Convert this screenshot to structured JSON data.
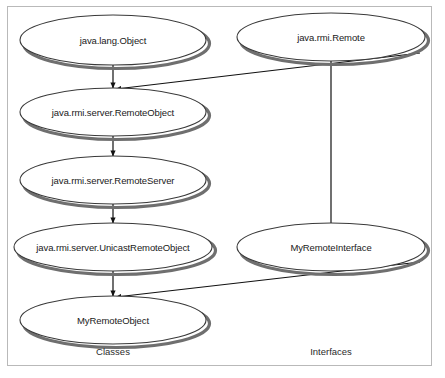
{
  "diagram": {
    "frame": {
      "stroke": "#b9b9b9"
    },
    "style": {
      "node_fill": "#ffffff",
      "node_stroke": "#3a3a3a",
      "node_shadow": "#6f6f6f",
      "edge_color": "#111111",
      "text_color": "#1a1a1a"
    },
    "nodes": [
      {
        "id": "java-lang-object",
        "label": "java.lang.Object",
        "kind": "class",
        "cx": 113,
        "cy": 40,
        "rx": 93,
        "ry": 25,
        "font_size": 9.5
      },
      {
        "id": "java-rmi-remote",
        "label": "java.rmi.Remote",
        "kind": "interface",
        "cx": 331,
        "cy": 37,
        "rx": 94,
        "ry": 24,
        "font_size": 9.5
      },
      {
        "id": "java-rmi-server-remoteobject",
        "label": "java.rmi.server.RemoteObject",
        "kind": "class",
        "cx": 113,
        "cy": 112,
        "rx": 93,
        "ry": 24,
        "font_size": 9.5
      },
      {
        "id": "java-rmi-server-remoteserver",
        "label": "java.rmi.server.RemoteServer",
        "kind": "class",
        "cx": 113,
        "cy": 180,
        "rx": 93,
        "ry": 24,
        "font_size": 9.5
      },
      {
        "id": "java-rmi-server-unicastremoteobject",
        "label": "java.rmi.server.UnicastRemoteObject",
        "kind": "class",
        "cx": 113,
        "cy": 247,
        "rx": 99,
        "ry": 24,
        "font_size": 9.5
      },
      {
        "id": "myremoteinterface",
        "label": "MyRemoteInterface",
        "kind": "interface",
        "cx": 331,
        "cy": 247,
        "rx": 94,
        "ry": 24,
        "font_size": 9.5
      },
      {
        "id": "myremoteobject",
        "label": "MyRemoteObject",
        "kind": "class",
        "cx": 113,
        "cy": 320,
        "rx": 93,
        "ry": 24,
        "font_size": 9.5
      }
    ],
    "edges": [
      {
        "id": "object-to-remoteobject",
        "from": "java-lang-object",
        "to": "java-rmi-server-remoteobject",
        "relation": "extends",
        "arrow": true,
        "x1": 113,
        "y1": 64,
        "x2": 113,
        "y2": 88
      },
      {
        "id": "remote-to-remoteobject",
        "from": "java-rmi-remote",
        "to": "java-rmi-server-remoteobject",
        "relation": "implements",
        "arrow": true,
        "x1": 420,
        "y1": 53,
        "x2": 116,
        "y2": 89
      },
      {
        "id": "remoteobject-to-remoteserver",
        "from": "java-rmi-server-remoteobject",
        "to": "java-rmi-server-remoteserver",
        "relation": "extends",
        "arrow": true,
        "x1": 113,
        "y1": 136,
        "x2": 113,
        "y2": 156
      },
      {
        "id": "remoteserver-to-unicastremoteobject",
        "from": "java-rmi-server-remoteserver",
        "to": "java-rmi-server-unicastremoteobject",
        "relation": "extends",
        "arrow": true,
        "x1": 113,
        "y1": 204,
        "x2": 113,
        "y2": 223
      },
      {
        "id": "unicastremoteobject-to-myremoteobject",
        "from": "java-rmi-server-unicastremoteobject",
        "to": "myremoteobject",
        "relation": "extends",
        "arrow": true,
        "x1": 113,
        "y1": 271,
        "x2": 113,
        "y2": 296
      },
      {
        "id": "myremoteinterface-to-myremoteobject",
        "from": "myremoteinterface",
        "to": "myremoteobject",
        "relation": "implements",
        "arrow": true,
        "x1": 420,
        "y1": 262,
        "x2": 116,
        "y2": 297
      },
      {
        "id": "remote-to-myremoteinterface",
        "from": "java-rmi-remote",
        "to": "myremoteinterface",
        "relation": "extends",
        "arrow": false,
        "x1": 331,
        "y1": 61,
        "x2": 331,
        "y2": 223
      }
    ],
    "captions": [
      {
        "id": "classes",
        "label": "Classes",
        "cx": 113,
        "cy": 351
      },
      {
        "id": "interfaces",
        "label": "Interfaces",
        "cx": 331,
        "cy": 351
      }
    ]
  }
}
